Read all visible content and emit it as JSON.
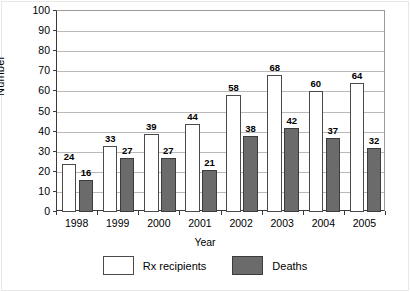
{
  "chart_data": {
    "type": "bar",
    "title": "",
    "xlabel": "Year",
    "ylabel": "Number",
    "categories": [
      "1998",
      "1999",
      "2000",
      "2001",
      "2002",
      "2003",
      "2004",
      "2005"
    ],
    "series": [
      {
        "name": "Rx recipients",
        "color": "#ffffff",
        "values": [
          24,
          33,
          39,
          44,
          58,
          68,
          60,
          64
        ]
      },
      {
        "name": "Deaths",
        "color": "#6b6b6b",
        "values": [
          16,
          27,
          27,
          21,
          38,
          42,
          37,
          32
        ]
      }
    ],
    "ylim": [
      0,
      100
    ],
    "y_ticks": [
      0,
      10,
      20,
      30,
      40,
      50,
      60,
      70,
      80,
      90,
      100
    ],
    "grid": true,
    "legend_position": "bottom",
    "data_labels": true
  },
  "axes": {
    "y_title": "Number",
    "x_title": "Year"
  },
  "legend": {
    "items": [
      {
        "label": "Rx recipients",
        "swatch": "white-square"
      },
      {
        "label": "Deaths",
        "swatch": "gray-square"
      }
    ]
  }
}
